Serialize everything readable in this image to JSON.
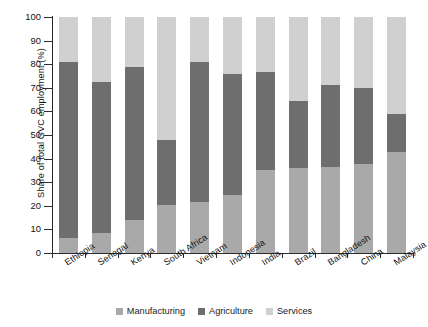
{
  "chart_data": {
    "type": "bar",
    "subtype": "stacked-bar-100-percent",
    "title": "",
    "xlabel": "",
    "ylabel": "Share of total GVC employment (%)",
    "ylim": [
      0,
      100
    ],
    "yticks": [
      0,
      10,
      20,
      30,
      40,
      50,
      60,
      70,
      80,
      90,
      100
    ],
    "grid": false,
    "legend_position": "bottom",
    "stack_order_bottom_to_top": [
      "Manufacturing",
      "Agriculture",
      "Services"
    ],
    "categories": [
      "Ethiopia",
      "Senegal",
      "Kenya",
      "South Africa",
      "Vietnam",
      "Indonesia",
      "India",
      "Brazil",
      "Bangladesh",
      "China",
      "Malaysia"
    ],
    "series": [
      {
        "name": "Manufacturing",
        "color": "#a9a9a9",
        "values": [
          6.5,
          8.5,
          14,
          20.5,
          21.5,
          24.5,
          35,
          36,
          36.5,
          37.5,
          43
        ]
      },
      {
        "name": "Agriculture",
        "color": "#6e6e6e",
        "values": [
          74.5,
          64,
          65,
          27.5,
          59.5,
          51.5,
          41.5,
          28.5,
          34.5,
          32.5,
          16
        ]
      },
      {
        "name": "Services",
        "color": "#d0d0d0",
        "values": [
          19,
          27.5,
          21,
          52,
          19,
          24,
          23.5,
          35.5,
          29,
          30,
          41
        ]
      }
    ],
    "cumulative_tops": {
      "manufacturing_top": [
        6.5,
        8.5,
        14,
        20.5,
        21.5,
        24.5,
        35,
        36,
        36.5,
        37.5,
        43
      ],
      "agriculture_top": [
        81,
        72.5,
        79,
        48,
        81,
        76,
        76.5,
        64.5,
        71,
        70,
        59
      ],
      "services_top": [
        100,
        100,
        100,
        100,
        100,
        100,
        100,
        100,
        100,
        100,
        100
      ]
    }
  },
  "legend": {
    "items": [
      {
        "label": "Manufacturing",
        "color": "#a9a9a9"
      },
      {
        "label": "Agriculture",
        "color": "#6e6e6e"
      },
      {
        "label": "Services",
        "color": "#d0d0d0"
      }
    ]
  },
  "axis": {
    "y_title": "Share of total GVC employment (%)",
    "y_tick_labels": [
      "100",
      "90",
      "80",
      "70",
      "60",
      "50",
      "40",
      "30",
      "20",
      "10",
      "0"
    ]
  }
}
